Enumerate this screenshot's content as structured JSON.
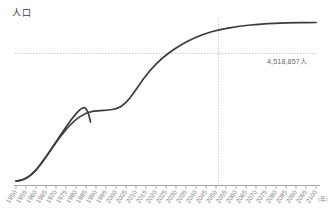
{
  "chart": {
    "title": "人口",
    "annotation_label": "4,518,857人",
    "axis_unit": "(年)"
  },
  "chart_data": {
    "type": "line",
    "title": "人口",
    "xlabel": "(年)",
    "ylabel": "人口",
    "grid": false,
    "legend": "none",
    "xlim": [
      1950,
      2100
    ],
    "ylim": [
      0,
      5200000
    ],
    "annotations": [
      {
        "label": "4,518,857人",
        "x": 2050,
        "y": 4518857,
        "marker": "dashed-crosshair"
      }
    ],
    "x": [
      1950,
      1955,
      1960,
      1965,
      1970,
      1975,
      1980,
      1985,
      1990,
      1995,
      2000,
      2005,
      2010,
      2015,
      2020,
      2025,
      2030,
      2035,
      2040,
      2045,
      2050,
      2055,
      2060,
      2065,
      2070,
      2075,
      2080,
      2085,
      2090,
      2095,
      2100
    ],
    "values": [
      120000,
      200000,
      360000,
      560000,
      790000,
      1030000,
      1300000,
      1570000,
      1830000,
      2010000,
      2130000,
      2250000,
      2360000,
      2480000,
      2790000,
      3110000,
      3340000,
      3560000,
      3800000,
      4080000,
      4518857,
      4680000,
      4790000,
      4870000,
      4930000,
      4975000,
      5010000,
      5035000,
      5055000,
      5068000,
      5075000
    ],
    "xtick_labels": [
      "1950",
      "1955",
      "1960",
      "1965",
      "1970",
      "1975",
      "1980",
      "1985",
      "1990",
      "1995",
      "2000",
      "2005",
      "2010",
      "2015",
      "2020",
      "2025",
      "2030",
      "2035",
      "2040",
      "2045",
      "2050",
      "2055",
      "2060",
      "2065",
      "2070",
      "2075",
      "2080",
      "2085",
      "2090",
      "2095",
      "2100"
    ],
    "line_color": "#3c3c3c",
    "dash_color": "#b9b9b9",
    "axis_color": "#8f8f8f"
  }
}
